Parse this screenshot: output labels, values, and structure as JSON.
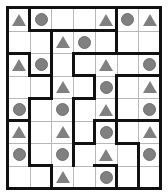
{
  "puzzle": {
    "cols": 7,
    "rows": 8,
    "colors": {
      "shape": "#808080",
      "wall": "#111111",
      "grid": "#b8b8b8",
      "background": "#ffffff"
    },
    "grid": [
      [
        "triangle",
        "circle",
        "",
        "",
        "triangle",
        "circle",
        "triangle"
      ],
      [
        "",
        "",
        "triangle",
        "circle",
        "",
        "",
        ""
      ],
      [
        "triangle",
        "circle",
        "",
        "",
        "triangle",
        "",
        "circle"
      ],
      [
        "",
        "",
        "triangle",
        "",
        "circle",
        "",
        "triangle"
      ],
      [
        "circle",
        "",
        "circle",
        "",
        "triangle",
        "",
        "circle"
      ],
      [
        "triangle",
        "",
        "triangle",
        "",
        "circle",
        "",
        "triangle"
      ],
      [
        "circle",
        "",
        "circle",
        "",
        "triangle",
        "",
        "circle"
      ],
      [
        "",
        "",
        "triangle",
        "",
        "circle",
        "",
        ""
      ]
    ],
    "vertical_walls": [
      [
        1,
        0
      ],
      [
        1,
        2
      ],
      [
        1,
        4
      ],
      [
        1,
        5
      ],
      [
        1,
        6
      ],
      [
        2,
        1
      ],
      [
        2,
        2
      ],
      [
        2,
        3
      ],
      [
        2,
        7
      ],
      [
        3,
        2
      ],
      [
        3,
        4
      ],
      [
        3,
        5
      ],
      [
        3,
        6
      ],
      [
        4,
        3
      ],
      [
        4,
        5
      ],
      [
        5,
        0
      ],
      [
        5,
        1
      ],
      [
        5,
        3
      ],
      [
        5,
        4
      ],
      [
        5,
        5
      ],
      [
        5,
        7
      ],
      [
        6,
        6
      ],
      [
        6,
        7
      ]
    ],
    "horizontal_walls": [
      [
        1,
        1
      ],
      [
        1,
        2
      ],
      [
        1,
        3
      ],
      [
        1,
        4
      ],
      [
        2,
        0
      ],
      [
        2,
        3
      ],
      [
        2,
        4
      ],
      [
        2,
        5
      ],
      [
        2,
        6
      ],
      [
        3,
        1
      ],
      [
        3,
        3
      ],
      [
        3,
        5
      ],
      [
        3,
        6
      ],
      [
        4,
        1
      ],
      [
        4,
        3
      ],
      [
        5,
        0
      ],
      [
        5,
        4
      ],
      [
        5,
        5
      ],
      [
        5,
        6
      ],
      [
        6,
        3
      ],
      [
        6,
        5
      ],
      [
        7,
        1
      ],
      [
        7,
        4
      ]
    ]
  }
}
